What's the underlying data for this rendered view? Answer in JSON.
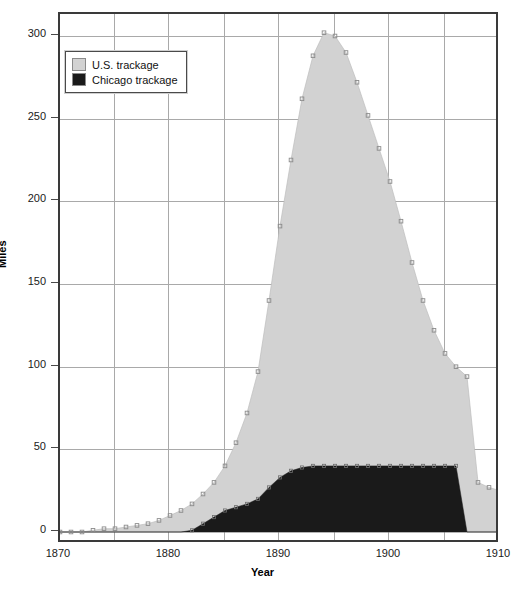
{
  "chart_data": {
    "type": "area",
    "title": "",
    "xlabel": "Year",
    "ylabel": "Miles",
    "xlim": [
      1870,
      1910
    ],
    "ylim": [
      0,
      300
    ],
    "xticks": [
      1870,
      1880,
      1890,
      1900,
      1910
    ],
    "yticks": [
      0,
      50,
      100,
      150,
      200,
      250,
      300
    ],
    "grid": true,
    "stacked": false,
    "legend_position": "top-left",
    "legend": [
      "U.S. trackage",
      "Chicago trackage"
    ],
    "colors": {
      "us": "#d2d2d2",
      "chicago": "#1a1a1a",
      "marker": "#8c8c8c",
      "grid": "#a9a9a9",
      "axis": "#3a3a3a"
    },
    "x": [
      1870,
      1871,
      1872,
      1873,
      1874,
      1875,
      1876,
      1877,
      1878,
      1879,
      1880,
      1881,
      1882,
      1883,
      1884,
      1885,
      1886,
      1887,
      1888,
      1889,
      1890,
      1891,
      1892,
      1893,
      1894,
      1895,
      1896,
      1897,
      1898,
      1899,
      1900,
      1901,
      1902,
      1903,
      1904,
      1905,
      1906,
      1907,
      1908,
      1909,
      1910
    ],
    "series": [
      {
        "name": "U.S. trackage",
        "values": [
          0,
          0,
          0,
          1,
          2,
          2,
          3,
          4,
          5,
          7,
          10,
          13,
          17,
          23,
          30,
          40,
          54,
          72,
          97,
          140,
          185,
          225,
          262,
          288,
          302,
          300,
          290,
          272,
          252,
          232,
          212,
          188,
          163,
          140,
          122,
          108,
          100,
          94,
          30,
          27,
          25
        ]
      },
      {
        "name": "Chicago trackage",
        "values": [
          0,
          0,
          0,
          0,
          0,
          0,
          0,
          0,
          0,
          0,
          0,
          0,
          1,
          5,
          9,
          13,
          15,
          17,
          20,
          27,
          33,
          37,
          39,
          40,
          40,
          40,
          40,
          40,
          40,
          40,
          40,
          40,
          40,
          40,
          40,
          40,
          40,
          0,
          0,
          0,
          0
        ]
      }
    ],
    "annotations": {
      "peak_year": 1894,
      "peak_value": 302,
      "chicago_plateau_value": 40,
      "chicago_end_year": 1906
    }
  }
}
